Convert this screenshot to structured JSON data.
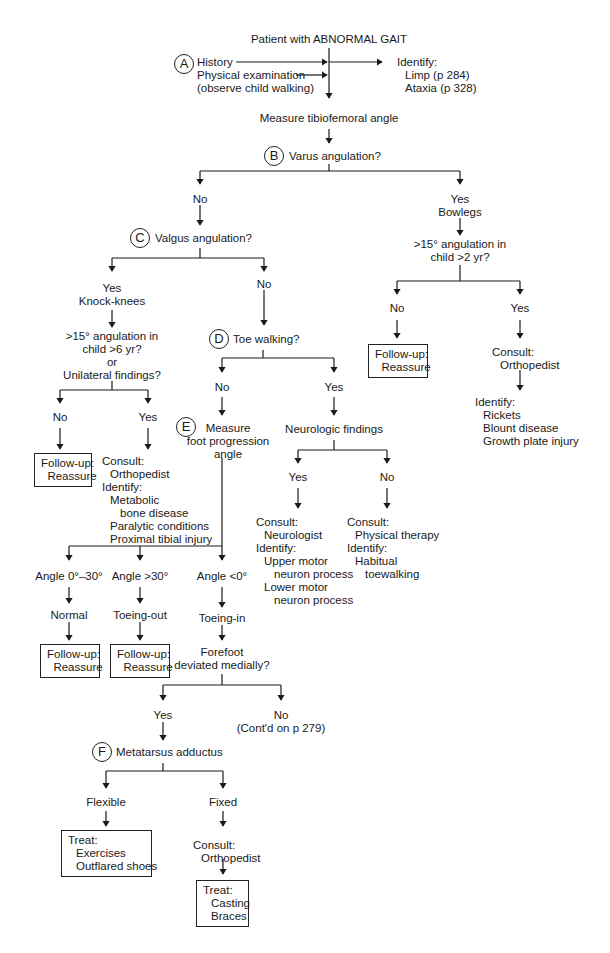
{
  "title": "Patient with ABNORMAL GAIT",
  "step_a": {
    "marker": "A",
    "lines": [
      "History",
      "Physical examination",
      "(observe child walking)"
    ],
    "identify": {
      "label": "Identify:",
      "items": [
        "Limp (p 284)",
        "Ataxia (p 328)"
      ]
    }
  },
  "measure_tibiofemoral": "Measure tibiofemoral angle",
  "step_b": {
    "marker": "B",
    "question": "Varus angulation?"
  },
  "b_no": "No",
  "b_yes": {
    "line1": "Yes",
    "line2": "Bowlegs"
  },
  "bowlegs_q": {
    "line1": ">15° angulation in",
    "line2": "child >2 yr?"
  },
  "bowlegs_no": "No",
  "bowlegs_yes": "Yes",
  "bowlegs_followup": {
    "line1": "Follow-up:",
    "line2": "Reassure"
  },
  "bowlegs_consult": {
    "line1": "Consult:",
    "line2": "Orthopedist"
  },
  "bowlegs_identify": {
    "label": "Identify:",
    "items": [
      "Rickets",
      "Blount disease",
      "Growth plate injury"
    ]
  },
  "step_c": {
    "marker": "C",
    "question": "Valgus angulation?"
  },
  "c_yes": {
    "line1": "Yes",
    "line2": "Knock-knees"
  },
  "c_no": "No",
  "knock_q": {
    "line1": ">15° angulation in",
    "line2": "child >6 yr?",
    "line3": "or",
    "line4": "Unilateral findings?"
  },
  "knock_no": "No",
  "knock_yes": "Yes",
  "knock_followup": {
    "line1": "Follow-up:",
    "line2": "Reassure"
  },
  "knock_consult": {
    "line1": "Consult:",
    "line2": "Orthopedist",
    "line3": "Identify:",
    "line4": "Metabolic",
    "line5": "bone disease",
    "line6": "Paralytic conditions",
    "line7": "Proximal tibial injury"
  },
  "step_d": {
    "marker": "D",
    "question": "Toe walking?"
  },
  "d_no": "No",
  "d_yes": "Yes",
  "step_e": {
    "marker": "E",
    "line1": "Measure",
    "line2": "foot progression",
    "line3": "angle"
  },
  "neuro": "Neurologic findings",
  "neuro_yes": "Yes",
  "neuro_no": "No",
  "neuro_yes_consult": {
    "line1": "Consult:",
    "line2": "Neurologist",
    "line3": "Identify:",
    "line4": "Upper motor",
    "line5": "neuron process",
    "line6": "Lower motor",
    "line7": "neuron process"
  },
  "neuro_no_consult": {
    "line1": "Consult:",
    "line2": "Physical therapy",
    "line3": "Identify:",
    "line4": "Habitual",
    "line5": "toewalking"
  },
  "angles": [
    {
      "angle": "Angle 0°–30°",
      "result": "Normal",
      "followup1": "Follow-up:",
      "followup2": "Reassure"
    },
    {
      "angle": "Angle >30°",
      "result": "Toeing-out",
      "followup1": "Follow-up:",
      "followup2": "Reassure"
    },
    {
      "angle": "Angle <0°",
      "result": "Toeing-in"
    }
  ],
  "forefoot_q": {
    "line1": "Forefoot",
    "line2": "deviated medially?"
  },
  "forefoot_yes": "Yes",
  "forefoot_no": {
    "line1": "No",
    "line2": "(Cont'd on p 279)"
  },
  "step_f": {
    "marker": "F",
    "label": "Metatarsus adductus"
  },
  "flexible": "Flexible",
  "fixed": "Fixed",
  "flexible_treat": {
    "line1": "Treat:",
    "line2": "Exercises",
    "line3": "Outflared shoes"
  },
  "fixed_consult": {
    "line1": "Consult:",
    "line2": "Orthopedist"
  },
  "fixed_treat": {
    "line1": "Treat:",
    "line2": "Casting",
    "line3": "Braces"
  }
}
